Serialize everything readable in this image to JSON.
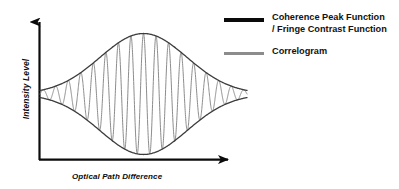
{
  "figure": {
    "title": "",
    "background_color": "#ffffff"
  },
  "axes": {
    "y_label": "Intensity Level",
    "x_label": "Optical Path Difference",
    "axis_color": "#0b0b0b",
    "y_arrow_icon": "up-arrow-icon",
    "x_arrow_icon": "right-arrow-icon"
  },
  "legend": {
    "position": "top-right",
    "items": [
      {
        "label": "Coherence Peak Function\n/ Fringe Contrast Function",
        "color": "#0a0a0a",
        "swatch_style": "thick"
      },
      {
        "label": "Correlogram",
        "color": "#8c8c8c",
        "swatch_style": "thin"
      }
    ]
  },
  "chart_data": {
    "type": "line",
    "title": "",
    "xlabel": "Optical Path Difference",
    "ylabel": "Intensity Level",
    "xlim": [
      0,
      1
    ],
    "ylim": [
      0,
      1
    ],
    "grid": false,
    "legend_position": "top-right",
    "annotations": [
      "Envelope curves cross near the left and right edges of the fringe burst",
      "Correlogram oscillations are bounded by the upper and lower envelopes"
    ],
    "model": {
      "envelope_shape": "gaussian",
      "envelope_center_x": 0.5,
      "envelope_sigma": 0.21,
      "envelope_peak_amplitude": 0.42,
      "baseline_level": 0.5,
      "fringe_cycles": 16.5,
      "fringe_phase_deg": 0,
      "x_start": 0.0,
      "x_end": 1.0
    },
    "series": [
      {
        "name": "Coherence Peak Function / Fringe Contrast Function",
        "role": "upper-envelope",
        "color": "#3a3a3a",
        "x": [
          0.0,
          0.05,
          0.1,
          0.15,
          0.2,
          0.25,
          0.3,
          0.35,
          0.4,
          0.45,
          0.5,
          0.55,
          0.6,
          0.65,
          0.7,
          0.75,
          0.8,
          0.85,
          0.9,
          0.95,
          1.0
        ],
        "values": [
          0.517,
          0.528,
          0.546,
          0.576,
          0.619,
          0.675,
          0.74,
          0.808,
          0.871,
          0.917,
          0.935,
          0.917,
          0.871,
          0.808,
          0.74,
          0.675,
          0.619,
          0.576,
          0.546,
          0.528,
          0.517
        ]
      },
      {
        "name": "Coherence Peak Function / Fringe Contrast Function",
        "role": "lower-envelope",
        "color": "#3a3a3a",
        "x": [
          0.0,
          0.05,
          0.1,
          0.15,
          0.2,
          0.25,
          0.3,
          0.35,
          0.4,
          0.45,
          0.5,
          0.55,
          0.6,
          0.65,
          0.7,
          0.75,
          0.8,
          0.85,
          0.9,
          0.95,
          1.0
        ],
        "values": [
          0.483,
          0.472,
          0.454,
          0.424,
          0.381,
          0.325,
          0.26,
          0.192,
          0.129,
          0.083,
          0.065,
          0.083,
          0.129,
          0.192,
          0.26,
          0.325,
          0.381,
          0.424,
          0.454,
          0.472,
          0.483
        ]
      },
      {
        "name": "Correlogram",
        "role": "oscillation",
        "color": "#8c8c8c",
        "description": "Cosine fringes modulated by the coherence envelope, 16.5 cycles across the plotted range"
      }
    ]
  }
}
